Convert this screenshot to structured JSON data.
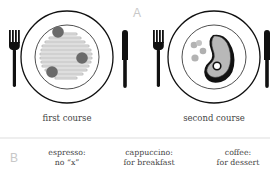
{
  "panel_a": {
    "label": "A",
    "courses": [
      {
        "caption": "first course",
        "dish": "spaghetti-with-meatballs"
      },
      {
        "caption": "second course",
        "dish": "steak-with-peas"
      }
    ]
  },
  "panel_b": {
    "label": "B",
    "items": [
      {
        "line1": "espresso:",
        "line2": "no “x”"
      },
      {
        "line1": "cappuccino:",
        "line2": "for breakfast"
      },
      {
        "line1": "coffee:",
        "line2": "for dessert"
      }
    ]
  },
  "colors": {
    "ink": "#111111",
    "food_gray": "#bfbfbf",
    "meatball": "#6e6e6e",
    "peas": "#b0b0b0",
    "label_gray": "#c8c8c8"
  }
}
